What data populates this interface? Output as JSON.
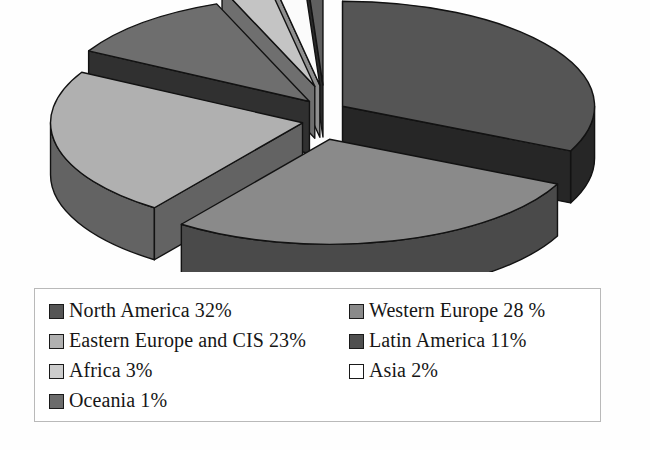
{
  "chart_data": {
    "type": "pie",
    "title": "",
    "subtitle": "",
    "xlabel": "",
    "ylabel": "",
    "style": "3d-exploded-pie",
    "grid": false,
    "legend_position": "bottom",
    "unit": "%",
    "categories": [
      "North America",
      "Western Europe",
      "Eastern Europe and CIS",
      "Latin America",
      "Africa",
      "Asia",
      "Oceania"
    ],
    "values": [
      32,
      28,
      23,
      11,
      3,
      2,
      1
    ],
    "slices": [
      {
        "label": "North America",
        "value": 32,
        "value_text": "32%",
        "top_color": "#555555",
        "side_color": "#262626",
        "start_angle": 0,
        "end_angle": 115.2,
        "exploded": true
      },
      {
        "label": "Western Europe",
        "value": 28,
        "value_text": "28 %",
        "top_color": "#8a8a8a",
        "side_color": "#4a4a4a",
        "start_angle": 115.2,
        "end_angle": 216.0,
        "exploded": true
      },
      {
        "label": "Eastern Europe and CIS",
        "value": 23,
        "value_text": "23%",
        "top_color": "#b0b0b0",
        "side_color": "#636363",
        "start_angle": 216.0,
        "end_angle": 298.8,
        "exploded": true
      },
      {
        "label": "Latin America",
        "value": 11,
        "value_text": "11%",
        "top_color": "#6e6e6e",
        "side_color": "#303030",
        "start_angle": 298.8,
        "end_angle": 338.4,
        "exploded": true
      },
      {
        "label": "Africa",
        "value": 3,
        "value_text": "3%",
        "top_color": "#c4c4c4",
        "side_color": "#6f6f6f",
        "start_angle": 338.4,
        "end_angle": 349.2,
        "exploded": true
      },
      {
        "label": "Asia",
        "value": 2,
        "value_text": "2%",
        "top_color": "#fbfbfb",
        "side_color": "#8f8f8f",
        "start_angle": 349.2,
        "end_angle": 356.4,
        "exploded": true
      },
      {
        "label": "Oceania",
        "value": 1,
        "value_text": "1%",
        "top_color": "#5f5f5f",
        "side_color": "#2a2a2a",
        "start_angle": 356.4,
        "end_angle": 360,
        "exploded": true
      }
    ]
  },
  "legend": {
    "entries": [
      {
        "text": "North America 32%",
        "swatch": "#555555"
      },
      {
        "text": "Western Europe 28 %",
        "swatch": "#8a8a8a"
      },
      {
        "text": "Eastern Europe and CIS 23%",
        "swatch": "#b0b0b0"
      },
      {
        "text": "Latin America 11%",
        "swatch": "#4f4f4f"
      },
      {
        "text": "Africa 3%",
        "swatch": "#cccccc"
      },
      {
        "text": "Asia 2%",
        "swatch": "#ffffff"
      },
      {
        "text": "Oceania 1%",
        "swatch": "#6b6b6b"
      }
    ]
  }
}
